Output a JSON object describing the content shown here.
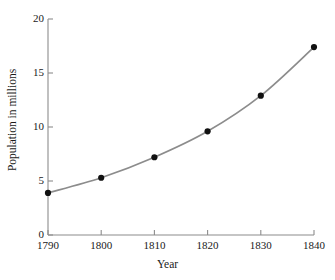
{
  "chart_data": {
    "type": "line",
    "title": "",
    "xlabel": "Year",
    "ylabel": "Population in millions",
    "x": [
      1790,
      1800,
      1810,
      1820,
      1830,
      1840
    ],
    "values": [
      3.9,
      5.3,
      7.2,
      9.6,
      12.9,
      17.4
    ],
    "categories": [
      "1790",
      "1800",
      "1810",
      "1820",
      "1830",
      "1840"
    ],
    "xlim": [
      1790,
      1840
    ],
    "ylim": [
      0,
      20
    ],
    "xticks": [
      "1790",
      "1800",
      "1810",
      "1820",
      "1830",
      "1840"
    ],
    "yticks": [
      "0",
      "5",
      "10",
      "15",
      "20"
    ],
    "ytick_values": [
      0,
      5,
      10,
      15,
      20
    ],
    "grid": false,
    "legend": null,
    "legend_position": "none",
    "marker": "filled-circle",
    "line_color": "#8c8c8c",
    "marker_color": "#111111",
    "axis_color": "#8c8c8c",
    "background_color": "#ffffff",
    "annotations": []
  },
  "axes": {
    "x_axis_label": "Year",
    "y_axis_label": "Population in millions"
  }
}
